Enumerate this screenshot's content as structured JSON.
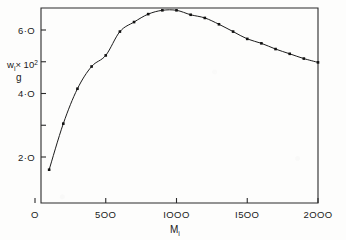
{
  "chart_data": {
    "type": "line",
    "title": "",
    "subtitle": "",
    "xlabel": "M_i",
    "ylabel": "w_i/g x 10^2",
    "ylabel_numerator": "w",
    "ylabel_numerator_sub": "i",
    "ylabel_times": "× 10",
    "ylabel_exponent": "2",
    "ylabel_denominator": "g",
    "xlabel_base": "M",
    "xlabel_sub": "i",
    "grid": false,
    "legend": null,
    "xlim": [
      0,
      2000
    ],
    "ylim": [
      0,
      7.2
    ],
    "xticks": [
      0,
      500,
      1000,
      1500,
      2000
    ],
    "xtick_labels": [
      "O",
      "5OO",
      "IOOO",
      "I5OO",
      "2OOO"
    ],
    "yticks": [
      2.0,
      3.0,
      4.0,
      5.0,
      6.0,
      7.0
    ],
    "ytick_labels_shown": {
      "2": "2·O",
      "4": "4·O",
      "6": "6·O"
    },
    "ytick_labeled_values": [
      2.0,
      4.0,
      6.0
    ],
    "marker": "square",
    "x": [
      100,
      200,
      300,
      400,
      500,
      600,
      700,
      800,
      900,
      1000,
      1100,
      1200,
      1300,
      1400,
      1500,
      1600,
      1700,
      1800,
      1900,
      2000
    ],
    "values": [
      1.6,
      3.05,
      4.15,
      4.85,
      5.2,
      5.95,
      6.25,
      6.5,
      6.62,
      6.62,
      6.48,
      6.38,
      6.18,
      5.95,
      5.72,
      5.58,
      5.4,
      5.25,
      5.1,
      4.98
    ],
    "series": [
      {
        "name": "w_i/g x 10^2",
        "values": [
          1.6,
          3.05,
          4.15,
          4.85,
          5.2,
          5.95,
          6.25,
          6.5,
          6.62,
          6.62,
          6.48,
          6.38,
          6.18,
          5.95,
          5.72,
          5.58,
          5.4,
          5.25,
          5.1,
          4.98
        ]
      }
    ],
    "annotations": [],
    "colors": {
      "curve": "#1c1c1c",
      "marker": "#111111",
      "axis": "#2a2a2a",
      "background": "#fdfdfc"
    }
  }
}
